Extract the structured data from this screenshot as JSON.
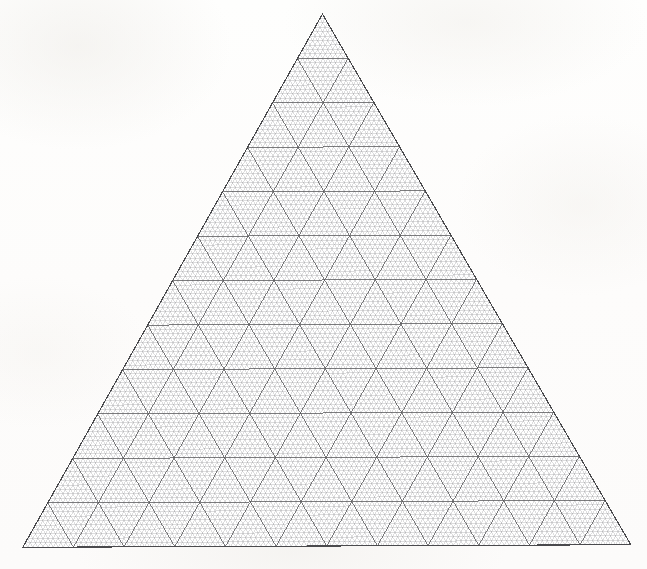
{
  "document": {
    "kind": "triangular-grid-paper",
    "title": "Ternary / triangular graph paper sheet",
    "background_color": "#fdfdfc",
    "page_width": 647,
    "page_height": 569
  },
  "chart_data": {
    "type": "scatter",
    "title": "",
    "subtitle": "",
    "xlabel": "",
    "ylabel": "",
    "grid": true,
    "legend_position": "none",
    "annotations": [],
    "categories": [],
    "values": [],
    "axis_labels": [],
    "tick_labels": [],
    "geometry": {
      "shape": "equilateral-triangle",
      "apex": [
        324,
        14
      ],
      "bottom_left": [
        22,
        546
      ],
      "bottom_right": [
        630,
        546
      ],
      "side_length_px": 608,
      "height_px": 532
    },
    "major_grid": {
      "divisions_per_side": 12,
      "line_color": "#57575a",
      "line_width": 0.85,
      "cell_width_px": 50.67,
      "cell_height_px": 44.33
    },
    "minor_grid": {
      "divisions_per_side": 120,
      "subdivisions_per_major_cell": 10,
      "line_color": "#9a9a9d",
      "line_width": 0.42,
      "cell_width_px": 5.07,
      "cell_height_px": 4.43
    },
    "outline": {
      "line_color": "#4a4a4d",
      "line_width": 1.15
    },
    "skew": {
      "rotation_deg": -0.25,
      "note": "slight scan rotation"
    }
  },
  "labels": {
    "axis_left": "",
    "axis_right": "",
    "axis_bottom": "",
    "caption": ""
  }
}
